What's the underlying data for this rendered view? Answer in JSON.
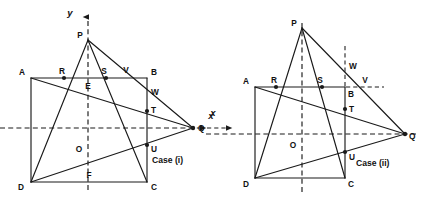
{
  "figure": {
    "title": "",
    "background_color": "#ffffff",
    "stroke_color": "#1a1a1a",
    "panels": [
      {
        "id": "case-i",
        "caption": "Case (i)",
        "caption_pos": {
          "x": 152,
          "y": 160
        },
        "axes": {
          "x_label": "x",
          "y_label": "y",
          "x_label_pos": {
            "x": 210,
            "y": 117
          },
          "y_label_pos": {
            "x": 69,
            "y": 16
          },
          "origin_label": "O",
          "origin_label_pos": {
            "x": 78,
            "y": 152
          },
          "x_axis": {
            "x1": 0,
            "y1": 128,
            "x2": 205,
            "y2": 128
          },
          "y_axis": {
            "x1": 88,
            "y1": 188,
            "x2": 88,
            "y2": 14
          }
        },
        "points": [
          {
            "name": "A",
            "x": 31,
            "y": 78,
            "label_dx": -9,
            "label_dy": -3,
            "dot": false
          },
          {
            "name": "B",
            "x": 147,
            "y": 78,
            "label_dx": 4,
            "label_dy": -3,
            "dot": false
          },
          {
            "name": "C",
            "x": 147,
            "y": 182,
            "label_dx": 4,
            "label_dy": 8,
            "dot": false
          },
          {
            "name": "D",
            "x": 31,
            "y": 182,
            "label_dx": -10,
            "label_dy": 8,
            "dot": false
          },
          {
            "name": "P",
            "x": 88,
            "y": 40,
            "label_dx": -8,
            "label_dy": -2,
            "dot": false
          },
          {
            "name": "Q",
            "x": 193,
            "y": 128,
            "label_dx": 5,
            "label_dy": 3,
            "dot": false
          },
          {
            "name": "R",
            "x": 64,
            "y": 78,
            "label_dx": -2,
            "label_dy": -3,
            "dot": true
          },
          {
            "name": "S",
            "x": 106,
            "y": 78,
            "label_dx": -2,
            "label_dy": -3,
            "dot": true
          },
          {
            "name": "V",
            "x": 127,
            "y": 78,
            "label_dx": -2,
            "label_dy": -4,
            "dot": false
          },
          {
            "name": "E",
            "x": 88,
            "y": 78,
            "label_dx": -1,
            "label_dy": 10,
            "dot": false
          },
          {
            "name": "W",
            "x": 147,
            "y": 92,
            "label_dx": 4,
            "label_dy": 2,
            "dot": false
          },
          {
            "name": "T",
            "x": 147,
            "y": 111,
            "label_dx": 4,
            "label_dy": 2,
            "dot": true
          },
          {
            "name": "U",
            "x": 147,
            "y": 145,
            "label_dx": 4,
            "label_dy": 6,
            "dot": true
          },
          {
            "name": "F",
            "x": 88,
            "y": 182,
            "label_dx": -1,
            "label_dy": -4,
            "dot": false
          }
        ],
        "segments": [
          {
            "name": "rect-AB",
            "x1": 31,
            "y1": 78,
            "x2": 147,
            "y2": 78
          },
          {
            "name": "rect-BC",
            "x1": 147,
            "y1": 78,
            "x2": 147,
            "y2": 182
          },
          {
            "name": "rect-CD",
            "x1": 147,
            "y1": 182,
            "x2": 31,
            "y2": 182
          },
          {
            "name": "rect-DA",
            "x1": 31,
            "y1": 182,
            "x2": 31,
            "y2": 78
          },
          {
            "name": "PD",
            "x1": 88,
            "y1": 40,
            "x2": 31,
            "y2": 182
          },
          {
            "name": "PC",
            "x1": 88,
            "y1": 40,
            "x2": 147,
            "y2": 182
          },
          {
            "name": "PQ",
            "x1": 88,
            "y1": 40,
            "x2": 193,
            "y2": 128
          },
          {
            "name": "AQ",
            "x1": 31,
            "y1": 78,
            "x2": 193,
            "y2": 128
          },
          {
            "name": "DQ",
            "x1": 31,
            "y1": 182,
            "x2": 193,
            "y2": 128
          }
        ]
      },
      {
        "id": "case-ii",
        "caption": "Case (ii)",
        "caption_pos": {
          "x": 356,
          "y": 163
        },
        "axes": {
          "x_label": "x",
          "y_label": "",
          "x_label_pos": {
            "x": 212,
            "y": 113
          },
          "origin_label": "O",
          "origin_label_pos": {
            "x": 292,
            "y": 148
          },
          "x_axis": {
            "x1": 206,
            "y1": 134,
            "x2": 418,
            "y2": 134
          },
          "y_axis": {
            "x1": 302,
            "y1": 190,
            "x2": 302,
            "y2": 22
          },
          "v_guide": {
            "x1": 345,
            "y1": 48,
            "x2": 345,
            "y2": 92
          },
          "h_guide": {
            "x1": 345,
            "y1": 87,
            "x2": 382,
            "y2": 87
          }
        },
        "points": [
          {
            "name": "A",
            "x": 255,
            "y": 87,
            "label_dx": -10,
            "label_dy": -3,
            "dot": false
          },
          {
            "name": "B",
            "x": 345,
            "y": 87,
            "label_dx": 3,
            "label_dy": 10,
            "dot": false
          },
          {
            "name": "C",
            "x": 345,
            "y": 178,
            "label_dx": 3,
            "label_dy": 9,
            "dot": false
          },
          {
            "name": "D",
            "x": 255,
            "y": 178,
            "label_dx": -10,
            "label_dy": 9,
            "dot": false
          },
          {
            "name": "P",
            "x": 302,
            "y": 28,
            "label_dx": -9,
            "label_dy": -2,
            "dot": false
          },
          {
            "name": "Q",
            "x": 405,
            "y": 134,
            "label_dx": 5,
            "label_dy": 4,
            "dot": false
          },
          {
            "name": "R",
            "x": 276,
            "y": 87,
            "label_dx": -2,
            "label_dy": -3,
            "dot": true
          },
          {
            "name": "S",
            "x": 322,
            "y": 87,
            "label_dx": -2,
            "label_dy": -3,
            "dot": true
          },
          {
            "name": "W",
            "x": 345,
            "y": 66,
            "label_dx": 4,
            "label_dy": 1,
            "dot": false
          },
          {
            "name": "V",
            "x": 365,
            "y": 84,
            "label_dx": -2,
            "label_dy": -3,
            "dot": false
          },
          {
            "name": "T",
            "x": 345,
            "y": 109,
            "label_dx": 4,
            "label_dy": 2,
            "dot": true
          },
          {
            "name": "U",
            "x": 345,
            "y": 152,
            "label_dx": 4,
            "label_dy": 7,
            "dot": true
          }
        ],
        "segments": [
          {
            "name": "rect-AB",
            "x1": 255,
            "y1": 87,
            "x2": 345,
            "y2": 87
          },
          {
            "name": "rect-BC",
            "x1": 345,
            "y1": 87,
            "x2": 345,
            "y2": 178
          },
          {
            "name": "rect-CD",
            "x1": 345,
            "y1": 178,
            "x2": 255,
            "y2": 178
          },
          {
            "name": "rect-DA",
            "x1": 255,
            "y1": 178,
            "x2": 255,
            "y2": 87
          },
          {
            "name": "PD",
            "x1": 302,
            "y1": 28,
            "x2": 255,
            "y2": 178
          },
          {
            "name": "PC",
            "x1": 302,
            "y1": 28,
            "x2": 345,
            "y2": 178
          },
          {
            "name": "PQ",
            "x1": 302,
            "y1": 28,
            "x2": 405,
            "y2": 134
          },
          {
            "name": "AQ",
            "x1": 255,
            "y1": 87,
            "x2": 405,
            "y2": 134
          },
          {
            "name": "DQ",
            "x1": 255,
            "y1": 178,
            "x2": 405,
            "y2": 134
          }
        ]
      }
    ]
  }
}
